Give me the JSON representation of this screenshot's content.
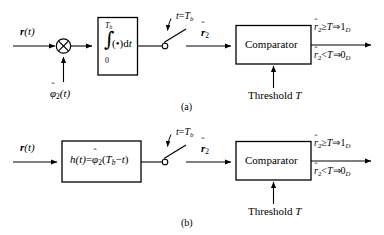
{
  "figure": {
    "type": "block-diagram",
    "line_color": "#000000",
    "background": "#ffffff"
  },
  "panel_a": {
    "caption": "(a)",
    "input_label": {
      "bold_italic": "r",
      "paren": "(t)"
    },
    "multiplier": {
      "symbol": "⨂",
      "name": "product-modulator"
    },
    "local_signal_label": {
      "base": "φ",
      "hat": "ˆ",
      "subscript": "2",
      "argument": "(t)"
    },
    "integrator_block": {
      "upper_limit": "T",
      "upper_limit_sub": "b",
      "lower_limit": "0",
      "integrand": "(•)d",
      "integrand_var": "t",
      "integral_symbol": "∫"
    },
    "switch_label": {
      "lhs": "t",
      "eq": "=",
      "rhs": "T",
      "rhs_sub": "b"
    },
    "switch_output_label": {
      "base": "r",
      "hat": "ˆ",
      "subscript": "2"
    },
    "comparator_label": "Comparator",
    "threshold_label": {
      "text": "Threshold",
      "symbol": "T"
    },
    "decision_rules": [
      {
        "stat": "r",
        "hat": "ˆ",
        "stat_sub": "2",
        "relation": "≥",
        "threshold": "T",
        "implies": "⇒",
        "decision": "1",
        "decision_sub": "D"
      },
      {
        "stat": "r",
        "hat": "ˆ",
        "stat_sub": "2",
        "relation": "<",
        "threshold": "T",
        "implies": "⇒",
        "decision": "0",
        "decision_sub": "D"
      }
    ]
  },
  "panel_b": {
    "caption": "(b)",
    "input_label": {
      "bold_italic": "r",
      "paren": "(t)"
    },
    "filter_block": {
      "lhs": "h",
      "lhs_arg": "(t)",
      "eq": "=",
      "rhs_base": "φ",
      "rhs_hat": "ˆ",
      "rhs_sub": "2",
      "rhs_arg_open": "(",
      "rhs_arg_T": "T",
      "rhs_arg_T_sub": "b",
      "rhs_arg_minus": "−",
      "rhs_arg_t": "t",
      "rhs_arg_close": ")"
    },
    "switch_label": {
      "lhs": "t",
      "eq": "=",
      "rhs": "T",
      "rhs_sub": "b"
    },
    "switch_output_label": {
      "base": "r",
      "hat": "ˆ",
      "subscript": "2"
    },
    "comparator_label": "Comparator",
    "threshold_label": {
      "text": "Threshold",
      "symbol": "T"
    },
    "decision_rules": [
      {
        "stat": "r",
        "hat": "ˆ",
        "stat_sub": "2",
        "relation": "≥",
        "threshold": "T",
        "implies": "⇒",
        "decision": "1",
        "decision_sub": "D"
      },
      {
        "stat": "r",
        "hat": "ˆ",
        "stat_sub": "2",
        "relation": "<",
        "threshold": "T",
        "implies": "⇒",
        "decision": "0",
        "decision_sub": "D"
      }
    ]
  }
}
